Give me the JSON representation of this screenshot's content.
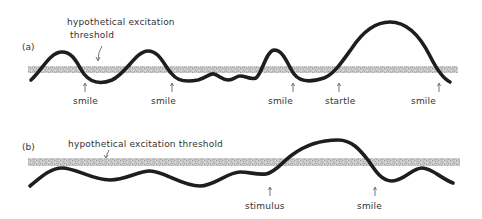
{
  "diagram": {
    "colors": {
      "curve": "#1e1e1e",
      "threshold_band": "#bdbdbd",
      "text": "#333333",
      "background": "#ffffff"
    },
    "panels": [
      {
        "id": "a",
        "label": "(a)",
        "threshold_label_line1": "hypothetical excitation",
        "threshold_label_line2": "threshold",
        "events": [
          {
            "label": "smile",
            "x": 85
          },
          {
            "label": "smile",
            "x": 172
          },
          {
            "label": "smile",
            "x": 293
          },
          {
            "label": "startle",
            "x": 339
          },
          {
            "label": "smile",
            "x": 439
          }
        ]
      },
      {
        "id": "b",
        "label": "(b)",
        "threshold_label": "hypothetical excitation threshold",
        "events": [
          {
            "label": "stimulus",
            "x": 270
          },
          {
            "label": "smile",
            "x": 375
          }
        ]
      }
    ]
  }
}
